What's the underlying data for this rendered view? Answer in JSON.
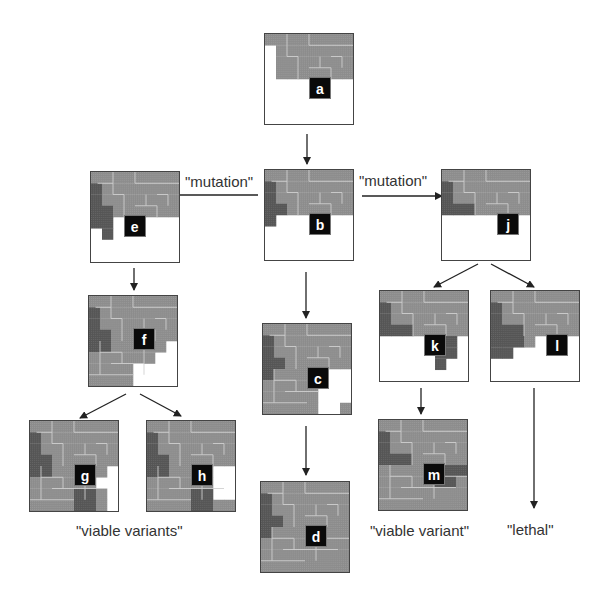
{
  "diagram": {
    "nodes": [
      {
        "id": "a",
        "label": "a",
        "x": 264,
        "y": 33,
        "fill_rows": 4,
        "tag_col": 4,
        "tag_row": 4,
        "white": "bottom-half",
        "dark": []
      },
      {
        "id": "b",
        "label": "b",
        "x": 264,
        "y": 169,
        "fill_rows": 4,
        "tag_col": 4,
        "tag_row": 4,
        "white": "bottom-half",
        "dark": [
          "left-column"
        ]
      },
      {
        "id": "c",
        "label": "c",
        "x": 262,
        "y": 323,
        "tag_col": 4,
        "tag_row": 4,
        "white": "bottom-right-block",
        "dark": [
          "left-column"
        ]
      },
      {
        "id": "d",
        "label": "d",
        "x": 260,
        "y": 481,
        "tag_col": 4,
        "tag_row": 4,
        "white": "none",
        "dark": [
          "left-column"
        ]
      },
      {
        "id": "e",
        "label": "e",
        "x": 90,
        "y": 171,
        "tag_col": 3,
        "tag_row": 4,
        "white": "bottom-half",
        "dark": [
          "left-column"
        ]
      },
      {
        "id": "f",
        "label": "f",
        "x": 88,
        "y": 295,
        "tag_col": 4,
        "tag_row": 3,
        "white": "bottom-right-stair",
        "dark": [
          "left-column"
        ]
      },
      {
        "id": "g",
        "label": "g",
        "x": 29,
        "y": 420,
        "tag_col": 4,
        "tag_row": 4,
        "white": "right-strip",
        "dark": [
          "left-column",
          "bottom-right"
        ]
      },
      {
        "id": "h",
        "label": "h",
        "x": 146,
        "y": 420,
        "tag_col": 4,
        "tag_row": 4,
        "white": "right-block",
        "dark": [
          "left-column",
          "bottom-right"
        ]
      },
      {
        "id": "j",
        "label": "j",
        "x": 441,
        "y": 169,
        "tag_col": 5,
        "tag_row": 4,
        "white": "bottom-half",
        "dark": [
          "left-l"
        ]
      },
      {
        "id": "k",
        "label": "k",
        "x": 379,
        "y": 290,
        "tag_col": 4,
        "tag_row": 4,
        "white": "bottom-half",
        "dark": [
          "left-l",
          "right-drop"
        ]
      },
      {
        "id": "l",
        "label": "l",
        "x": 490,
        "y": 290,
        "tag_col": 5,
        "tag_row": 4,
        "white": "bottom-half",
        "dark": [
          "left-big"
        ]
      },
      {
        "id": "m",
        "label": "m",
        "x": 378,
        "y": 419,
        "tag_col": 4,
        "tag_row": 4,
        "white": "none",
        "dark": [
          "left-l",
          "right-mid"
        ]
      }
    ],
    "edge_labels": {
      "mutation_left": "\"mutation\"",
      "mutation_right": "\"mutation\"",
      "viable_variants": "\"viable variants\"",
      "viable_variant": "\"viable variant\"",
      "lethal": "\"lethal\""
    },
    "edges": [
      {
        "from": "a",
        "to": "b"
      },
      {
        "from": "b",
        "to": "e",
        "label": "mutation"
      },
      {
        "from": "b",
        "to": "j",
        "label": "mutation"
      },
      {
        "from": "b",
        "to": "c"
      },
      {
        "from": "c",
        "to": "d"
      },
      {
        "from": "e",
        "to": "f"
      },
      {
        "from": "f",
        "to": "g"
      },
      {
        "from": "f",
        "to": "h"
      },
      {
        "from": "j",
        "to": "k"
      },
      {
        "from": "j",
        "to": "l"
      },
      {
        "from": "k",
        "to": "m"
      },
      {
        "from": "l",
        "to": "lethal"
      }
    ],
    "colors": {
      "piece": "#8c8c8c",
      "piece_outline": "#cfcfcf",
      "dark_piece": "#555555",
      "tag": "#0a0a0a",
      "arrow": "#222222",
      "border": "#444444"
    }
  }
}
